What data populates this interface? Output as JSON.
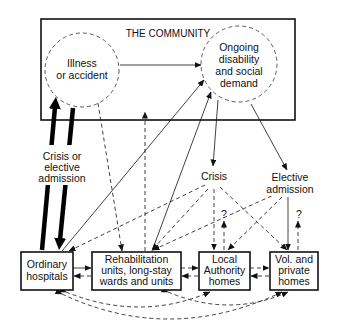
{
  "diagram": {
    "community": {
      "title": "THE COMMUNITY"
    },
    "nodes": {
      "illness": {
        "line1": "Illness",
        "line2": "or accident"
      },
      "ongoing": {
        "line1": "Ongoing",
        "line2": "disability",
        "line3": "and social",
        "line4": "demand"
      },
      "crisis": {
        "label": "Crisis"
      },
      "elective": {
        "line1": "Elective",
        "line2": "admission"
      },
      "crisis_or_elective": {
        "line1": "Crisis or",
        "line2": "elective",
        "line3": "admission"
      },
      "ordinary": {
        "line1": "Ordinary",
        "line2": "hospitals"
      },
      "rehab": {
        "line1": "Rehabilitation",
        "line2": "units, long-stay",
        "line3": "wards and units"
      },
      "local": {
        "line1": "Local",
        "line2": "Authority",
        "line3": "homes"
      },
      "vol": {
        "line1": "Vol. and",
        "line2": "private",
        "line3": "homes"
      }
    },
    "uncertain_marker": "?",
    "colors": {
      "ink": "#111111",
      "background": "#ffffff"
    },
    "edges": [
      {
        "from": "illness",
        "to": "ongoing",
        "style": "solid"
      },
      {
        "from": "illness",
        "to": "ordinary",
        "style": "heavy",
        "label": "Crisis or elective admission"
      },
      {
        "from": "ordinary",
        "to": "illness",
        "style": "heavy"
      },
      {
        "from": "illness",
        "to": "rehab",
        "style": "dashed"
      },
      {
        "from": "rehab",
        "to": "community",
        "style": "dashed"
      },
      {
        "from": "ordinary",
        "to": "ongoing",
        "style": "solid"
      },
      {
        "from": "rehab",
        "to": "ongoing",
        "style": "solid"
      },
      {
        "from": "ongoing",
        "to": "crisis",
        "style": "solid"
      },
      {
        "from": "ongoing",
        "to": "elective",
        "style": "solid"
      },
      {
        "from": "crisis",
        "to": "ordinary",
        "style": "dashed"
      },
      {
        "from": "crisis",
        "to": "rehab",
        "style": "dashed"
      },
      {
        "from": "crisis",
        "to": "local",
        "style": "dashed"
      },
      {
        "from": "crisis",
        "to": "vol",
        "style": "dashed"
      },
      {
        "from": "elective",
        "to": "rehab",
        "style": "dashed"
      },
      {
        "from": "elective",
        "to": "local",
        "style": "dashed"
      },
      {
        "from": "elective",
        "to": "vol",
        "style": "solid"
      },
      {
        "from": "local",
        "to": "?",
        "style": "dashed"
      },
      {
        "from": "vol",
        "to": "?",
        "style": "dashed"
      },
      {
        "from": "ordinary",
        "to": "rehab",
        "style": "solid"
      },
      {
        "from": "rehab",
        "to": "ordinary",
        "style": "dashed"
      },
      {
        "from": "rehab",
        "to": "local",
        "style": "dashed"
      },
      {
        "from": "local",
        "to": "rehab",
        "style": "dashed"
      },
      {
        "from": "local",
        "to": "vol",
        "style": "dashed"
      },
      {
        "from": "vol",
        "to": "local",
        "style": "dashed"
      },
      {
        "from": "ordinary",
        "to": "local",
        "style": "dashed-curve"
      },
      {
        "from": "ordinary",
        "to": "vol",
        "style": "dashed-curve"
      },
      {
        "from": "rehab",
        "to": "vol",
        "style": "dashed-curve"
      }
    ]
  }
}
